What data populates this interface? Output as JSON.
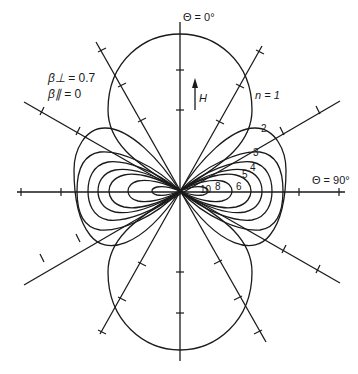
{
  "diagram": {
    "type": "polar radiation pattern",
    "axis_labels": {
      "top": "Θ = 0°",
      "right": "Θ = 90°"
    },
    "field_label": "H",
    "parameters": [
      {
        "symbol": "β⊥",
        "value": "= 0.7"
      },
      {
        "symbol": "β∥",
        "value": "= 0"
      }
    ],
    "harmonic_prefix": "n = 1",
    "curve_labels": [
      "2",
      "3",
      "4",
      "5",
      "6",
      "8",
      "10"
    ],
    "colors": {
      "ink": "#1a1a1a",
      "background": "#ffffff"
    }
  }
}
